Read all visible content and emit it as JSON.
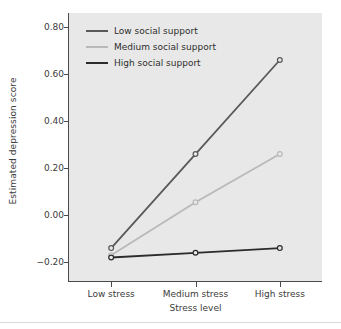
{
  "chart_data": {
    "type": "line",
    "title": "",
    "xlabel": "Stress level",
    "ylabel": "Estimated depression score",
    "categories": [
      "Low stress",
      "Medium stress",
      "High stress"
    ],
    "ylim": [
      -0.28,
      0.86
    ],
    "yticks": [
      "0.80",
      "0.60",
      "0.40",
      "0.20",
      "0.00",
      "-0.20"
    ],
    "ytick_values": [
      0.8,
      0.6,
      0.4,
      0.2,
      0.0,
      -0.2
    ],
    "grid": false,
    "legend_position": "upper left",
    "markers": "open-circle",
    "series": [
      {
        "name": "Low social support",
        "values": [
          -0.14,
          0.26,
          0.66
        ],
        "color": "#595959"
      },
      {
        "name": "Medium social support",
        "values": [
          -0.17,
          0.055,
          0.26
        ],
        "color": "#b9b9b9"
      },
      {
        "name": "High social support",
        "values": [
          -0.18,
          -0.16,
          -0.14
        ],
        "color": "#2b2b2b"
      }
    ]
  },
  "panel": {
    "background": "#e8e8e8",
    "axis_color": "#4a4a4a"
  }
}
